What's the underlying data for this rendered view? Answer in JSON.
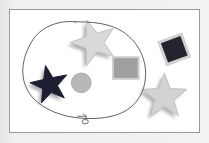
{
  "app": {
    "title": "Graphics Canvas",
    "active_tool": "lasso-select",
    "canvas_background": "#ffffff",
    "frame_border_color": "#9a9a9a",
    "panel_background": "#eceae8"
  },
  "canvas": {
    "width": 191,
    "height": 124,
    "label": "drawing-canvas"
  },
  "selection": {
    "name": "lasso-selection-path",
    "type": "freehand-lasso",
    "stroke_color": "#4a4a5a",
    "stroke_width": 0.9,
    "closed": true,
    "path": "M 66 12 C 48 10, 30 18, 22 32 C 13 47, 10 64, 16 78 C 22 93, 38 103, 58 108 C 78 112, 100 111, 114 104 C 128 97, 136 84, 137 68 C 138 50, 130 33, 114 22 C 100 13, 82 12, 66 12 Z",
    "cursor": {
      "name": "lasso-cursor",
      "x": 72,
      "y": 107,
      "color": "#6b6b6b"
    }
  },
  "shapes": [
    {
      "id": "star-top",
      "name": "star-shape-light-top",
      "type": "star",
      "points": 5,
      "cx": 85,
      "cy": 33,
      "outer_radius": 24,
      "inner_radius": 10,
      "rotation": -18,
      "fill": "#d9d9d9",
      "stroke": "#c2c2c2",
      "shadow_fill": "#b4b4b4",
      "shadow_offset": {
        "x": -3,
        "y": 3
      },
      "inside_selection": true
    },
    {
      "id": "star-left",
      "name": "star-shape-dark-left",
      "type": "star",
      "points": 5,
      "cx": 40,
      "cy": 76,
      "outer_radius": 20,
      "inner_radius": 8,
      "rotation": -12,
      "fill": "#1e1e32",
      "stroke": "#1e1e32",
      "shadow_fill": "#b0b0b0",
      "shadow_offset": {
        "x": -3,
        "y": 3
      },
      "inside_selection": true
    },
    {
      "id": "circle-center",
      "name": "circle-shape-gray",
      "type": "circle",
      "cx": 72,
      "cy": 74,
      "radius": 10,
      "fill": "#b8b8b8",
      "stroke": "#adadad",
      "inside_selection": true
    },
    {
      "id": "square-right",
      "name": "square-shape-gray",
      "type": "rect",
      "x": 104,
      "y": 48,
      "width": 26,
      "height": 22,
      "rotation": 0,
      "fill": "#9f9f9f",
      "stroke": "#cfcfcf",
      "stroke_width": 2,
      "inside_selection": true
    },
    {
      "id": "square-rotated",
      "name": "square-shape-dark-rotated",
      "type": "rect",
      "x": 154,
      "y": 28,
      "width": 24,
      "height": 24,
      "rotation": -20,
      "fill": "#24242e",
      "stroke": "#d2d2d2",
      "stroke_width": 3,
      "inside_selection": false
    },
    {
      "id": "star-bottom-right",
      "name": "star-shape-light-bottom-right",
      "type": "star",
      "points": 5,
      "cx": 156,
      "cy": 88,
      "outer_radius": 24,
      "inner_radius": 10,
      "rotation": 0,
      "fill": "#d3d3d3",
      "stroke": "#c0c0c0",
      "shadow_fill": "#b6b6b6",
      "shadow_offset": {
        "x": -3,
        "y": 3
      },
      "inside_selection": false
    }
  ],
  "colors": {
    "light_gray_fill": "#d9d9d9",
    "mid_gray_fill": "#b8b8b8",
    "dark_fill": "#1e1e32",
    "shadow": "#b4b4b4",
    "lasso_stroke": "#4a4a5a"
  }
}
